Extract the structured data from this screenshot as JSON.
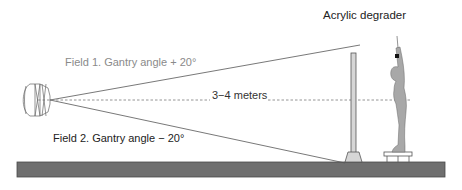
{
  "diagram": {
    "title_label": "Acrylic degrader",
    "field1_label": "Field 1. Gantry angle + 20°",
    "field2_label": "Field 2. Gantry angle − 20°",
    "distance_label": "3−4 meters",
    "components": {
      "gantry": "gantry-head",
      "beam_upper": "field-1-beam-edge",
      "beam_lower": "field-2-beam-edge",
      "central_axis": "dashed-central-axis",
      "degrader": "acrylic-degrader-stand",
      "patient": "standing-patient-arms-raised",
      "stool": "patient-platform",
      "floor": "floor"
    },
    "colors": {
      "floor": "#6f6f6f",
      "floor_edge": "#4a4a4a",
      "patient": "#a8a8a8",
      "degrader": "#d6d6d6",
      "beam_line": "#555555",
      "dash_line": "#888888",
      "field1_text": "#8a8a8a",
      "field2_text": "#222222",
      "distance_text": "#333333",
      "title_text": "#222222"
    }
  }
}
